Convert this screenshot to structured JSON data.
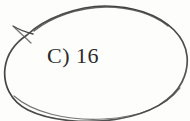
{
  "document": {
    "kind": "scanned-worksheet-snippet",
    "background_color": "#fdfdfc"
  },
  "answer": {
    "label": "C) 16",
    "option_letter": "C",
    "option_separator": ")",
    "option_value": "16",
    "text_color": "#2b2b2b",
    "font_style": "serif"
  },
  "annotation": {
    "name": "hand-drawn-oval",
    "description": "Hand-drawn pen oval circling the answer choice",
    "ink_color": "#4a4a4a",
    "ink_color_light": "#6e6e6e",
    "stroke_width": "1.6",
    "closure_note": "stroke starts and ends at upper-left with a small overshoot tail"
  }
}
